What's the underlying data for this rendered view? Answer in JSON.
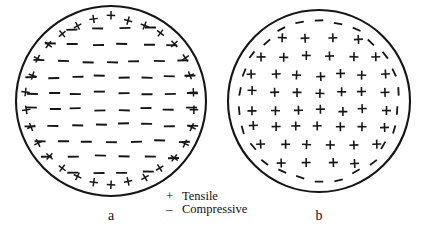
{
  "figure": {
    "background_color": "#ffffff",
    "stroke_color": "#16161a",
    "title": "",
    "panels": [
      {
        "id": "a",
        "label": "a",
        "center": [
          111,
          101
        ],
        "radius": 95,
        "description": "Circular cross-section with tensile plus symbols around the perimeter ring and compressive dashes filling the interior",
        "rim_symbol": "+",
        "core_symbol": "-",
        "rim_count": 30,
        "core_rows": [
          {
            "y": -72,
            "count": 4,
            "spacing": 25
          },
          {
            "y": -56,
            "count": 6,
            "spacing": 25
          },
          {
            "y": -40,
            "count": 7,
            "spacing": 24
          },
          {
            "y": -24,
            "count": 8,
            "spacing": 23
          },
          {
            "y": -8,
            "count": 8,
            "spacing": 23
          },
          {
            "y": 8,
            "count": 8,
            "spacing": 23
          },
          {
            "y": 24,
            "count": 8,
            "spacing": 23
          },
          {
            "y": 40,
            "count": 7,
            "spacing": 24
          },
          {
            "y": 56,
            "count": 6,
            "spacing": 25
          },
          {
            "y": 72,
            "count": 4,
            "spacing": 25
          }
        ]
      },
      {
        "id": "b",
        "label": "b",
        "center": [
          319,
          101
        ],
        "radius": 91,
        "description": "Circular cross-section with compressive dashes around the perimeter ring and tensile plus symbols filling the interior",
        "rim_symbol": "-",
        "core_symbol": "+",
        "rim_count": 26,
        "core_rows": [
          {
            "y": -62,
            "count": 4,
            "spacing": 25
          },
          {
            "y": -44,
            "count": 6,
            "spacing": 23
          },
          {
            "y": -26,
            "count": 7,
            "spacing": 22
          },
          {
            "y": -9,
            "count": 7,
            "spacing": 22
          },
          {
            "y": 9,
            "count": 7,
            "spacing": 22
          },
          {
            "y": 26,
            "count": 7,
            "spacing": 22
          },
          {
            "y": 44,
            "count": 6,
            "spacing": 23
          },
          {
            "y": 62,
            "count": 4,
            "spacing": 25
          }
        ]
      }
    ]
  },
  "legend": {
    "items": [
      {
        "symbol": "+",
        "label": "Tensile"
      },
      {
        "symbol": "–",
        "label": "Compressive"
      }
    ]
  }
}
